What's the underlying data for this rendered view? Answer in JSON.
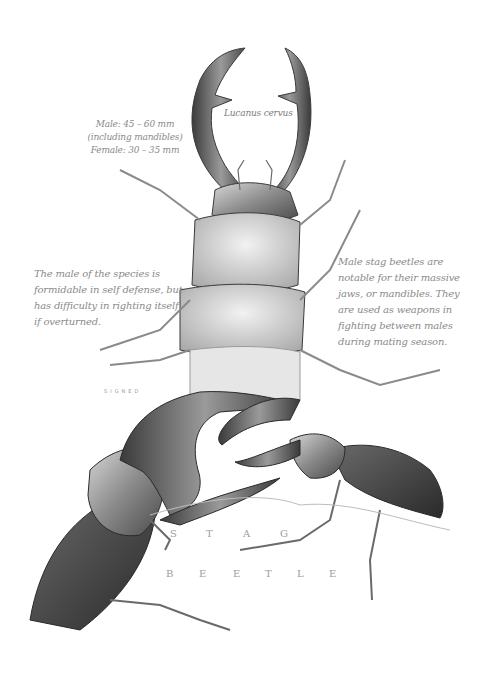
{
  "illustration": {
    "subject": "Stag beetle",
    "style": "graphite pencil scientific illustration with calligraphic annotations",
    "colors": {
      "background": "#ffffff",
      "ink": "#3a3a3a",
      "annotation": "#8a8a8a"
    }
  },
  "annotations": {
    "size": {
      "lines": [
        "Male: 45 – 60 mm",
        "(including mandibles)",
        "Female: 30 – 35 mm"
      ]
    },
    "species_name": "Lucanus cervus",
    "left_note": "The male of the species is formidable in self defense, but has difficulty in righting itself if overturned.",
    "right_note": "Male stag beetles are notable for their massive jaws, or mandibles. They are used as weapons in fighting between males during mating season.",
    "signature": "SIGNED"
  },
  "title": {
    "word1": [
      "S",
      "T",
      "A",
      "G"
    ],
    "word2": [
      "B",
      "E",
      "E",
      "T",
      "L",
      "E"
    ]
  }
}
